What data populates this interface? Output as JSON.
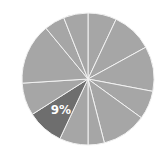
{
  "chart_data": {
    "type": "pie",
    "title": "",
    "center": [
      88,
      79
    ],
    "radius": 66,
    "start_angle_deg": 0,
    "direction": "clockwise",
    "slices": [
      {
        "value": 7,
        "label": "",
        "highlight": false
      },
      {
        "value": 10,
        "label": "",
        "highlight": false
      },
      {
        "value": 11,
        "label": "",
        "highlight": false
      },
      {
        "value": 7,
        "label": "",
        "highlight": false
      },
      {
        "value": 11,
        "label": "",
        "highlight": false
      },
      {
        "value": 4,
        "label": "",
        "highlight": false
      },
      {
        "value": 7,
        "label": "",
        "highlight": false
      },
      {
        "value": 9,
        "label": "9%",
        "highlight": true
      },
      {
        "value": 8,
        "label": "",
        "highlight": false
      },
      {
        "value": 15,
        "label": "",
        "highlight": false
      },
      {
        "value": 5,
        "label": "",
        "highlight": false
      },
      {
        "value": 6,
        "label": "",
        "highlight": false
      }
    ],
    "colors": {
      "default": "#a6a6a6",
      "highlight": "#6e6e6e",
      "separator": "#f2f2f2"
    },
    "legend": null
  }
}
